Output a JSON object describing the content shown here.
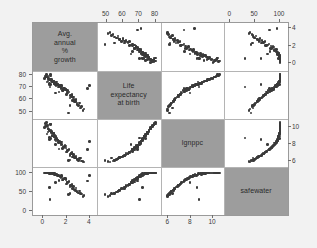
{
  "figure": {
    "type": "scatterplot-matrix",
    "background_color": "#f2f2f2",
    "panel_color": "#ffffff",
    "diagonal_cell_color": "#9d9d9d",
    "point_color": "#3a3a3a",
    "grid_color": "#b4b4b4"
  },
  "variables": [
    {
      "key": "growth",
      "label": "Avg.\nannual\n%\ngrowth",
      "axis_position_x": "bottom",
      "axis_position_y": "right",
      "ticks": [
        0,
        2,
        4
      ],
      "tick_labels": [
        "0",
        "2",
        "4"
      ],
      "range": [
        -0.9,
        4.6
      ]
    },
    {
      "key": "lifeexp",
      "label": "Life\nexpectancy\nat birth",
      "axis_position_x": "top",
      "axis_position_y": "left",
      "ticks": [
        50,
        60,
        70,
        80
      ],
      "tick_labels": [
        "50",
        "60",
        "70",
        "80"
      ],
      "range": [
        44,
        83
      ]
    },
    {
      "key": "lgnppc",
      "label": "lgnppc",
      "axis_position_x": "bottom",
      "axis_position_y": "right",
      "ticks": [
        6,
        8,
        10
      ],
      "tick_labels": [
        "6",
        "8",
        "10"
      ],
      "range": [
        5.3,
        11.0
      ]
    },
    {
      "key": "safewater",
      "label": "safewater",
      "axis_position_x": "top",
      "axis_position_y": "left",
      "ticks": [
        0,
        50,
        100
      ],
      "tick_labels": [
        "0",
        "50",
        "100"
      ],
      "range": [
        -12,
        116
      ]
    }
  ],
  "chart_data": {
    "type": "scatter",
    "title": "",
    "xlabel": "",
    "ylabel": "",
    "matrix_size": 4,
    "variable_names": [
      "Avg. annual % growth",
      "Life expectancy at birth",
      "lgnppc",
      "safewater"
    ],
    "axis_ranges": {
      "growth": [
        -0.9,
        4.6
      ],
      "lifeexp": [
        44,
        83
      ],
      "lgnppc": [
        5.3,
        11.0
      ],
      "safewater": [
        -12,
        116
      ]
    },
    "grid": true,
    "legend": "none",
    "observations": [
      {
        "growth": 0.6,
        "lifeexp": 72,
        "lgnppc": 8.7,
        "safewater": 99
      },
      {
        "growth": 0.3,
        "lifeexp": 74,
        "lgnppc": 9.2,
        "safewater": 100
      },
      {
        "growth": 0.5,
        "lifeexp": 76,
        "lgnppc": 9.6,
        "safewater": 100
      },
      {
        "growth": 0.4,
        "lifeexp": 77,
        "lgnppc": 9.9,
        "safewater": 100
      },
      {
        "growth": 0.7,
        "lifeexp": 75,
        "lgnppc": 9.4,
        "safewater": 100
      },
      {
        "growth": 0.2,
        "lifeexp": 78,
        "lgnppc": 10.1,
        "safewater": 100
      },
      {
        "growth": 0.9,
        "lifeexp": 73,
        "lgnppc": 8.9,
        "safewater": 98
      },
      {
        "growth": 1.1,
        "lifeexp": 71,
        "lgnppc": 8.4,
        "safewater": 96
      },
      {
        "growth": 0.8,
        "lifeexp": 74,
        "lgnppc": 9.0,
        "safewater": 99
      },
      {
        "growth": 0.4,
        "lifeexp": 79,
        "lgnppc": 10.3,
        "safewater": 100
      },
      {
        "growth": 0.1,
        "lifeexp": 77,
        "lgnppc": 10.0,
        "safewater": 100
      },
      {
        "growth": 0.6,
        "lifeexp": 80,
        "lgnppc": 10.4,
        "safewater": 100
      },
      {
        "growth": 1.3,
        "lifeexp": 70,
        "lgnppc": 8.2,
        "safewater": 93
      },
      {
        "growth": 1.5,
        "lifeexp": 69,
        "lgnppc": 7.9,
        "safewater": 88
      },
      {
        "growth": 1.0,
        "lifeexp": 72,
        "lgnppc": 8.6,
        "safewater": 95
      },
      {
        "growth": 1.7,
        "lifeexp": 67,
        "lgnppc": 7.6,
        "safewater": 83
      },
      {
        "growth": 2.1,
        "lifeexp": 65,
        "lgnppc": 7.2,
        "safewater": 74
      },
      {
        "growth": 2.4,
        "lifeexp": 63,
        "lgnppc": 6.9,
        "safewater": 68
      },
      {
        "growth": 2.8,
        "lifeexp": 60,
        "lgnppc": 6.6,
        "safewater": 60
      },
      {
        "growth": 3.1,
        "lifeexp": 57,
        "lgnppc": 6.3,
        "safewater": 52
      },
      {
        "growth": 2.6,
        "lifeexp": 62,
        "lgnppc": 6.8,
        "safewater": 64
      },
      {
        "growth": 2.2,
        "lifeexp": 66,
        "lgnppc": 7.4,
        "safewater": 78
      },
      {
        "growth": 1.9,
        "lifeexp": 68,
        "lgnppc": 7.8,
        "safewater": 86
      },
      {
        "growth": 1.4,
        "lifeexp": 71,
        "lgnppc": 8.3,
        "safewater": 92
      },
      {
        "growth": 0.5,
        "lifeexp": 73,
        "lgnppc": 8.8,
        "safewater": 97
      },
      {
        "growth": 2.0,
        "lifeexp": 64,
        "lgnppc": 7.1,
        "safewater": 71
      },
      {
        "growth": 2.3,
        "lifeexp": 61,
        "lgnppc": 6.7,
        "safewater": 63
      },
      {
        "growth": 2.7,
        "lifeexp": 58,
        "lgnppc": 6.4,
        "safewater": 55
      },
      {
        "growth": 3.0,
        "lifeexp": 55,
        "lgnppc": 6.1,
        "safewater": 47
      },
      {
        "growth": 1.2,
        "lifeexp": 72,
        "lgnppc": 8.5,
        "safewater": 94
      },
      {
        "growth": 0.7,
        "lifeexp": 76,
        "lgnppc": 9.5,
        "safewater": 100
      },
      {
        "growth": 1.6,
        "lifeexp": 70,
        "lgnppc": 8.0,
        "safewater": 90
      },
      {
        "growth": 1.8,
        "lifeexp": 69,
        "lgnppc": 7.7,
        "safewater": 85
      },
      {
        "growth": 2.5,
        "lifeexp": 59,
        "lgnppc": 6.5,
        "safewater": 58
      },
      {
        "growth": 3.3,
        "lifeexp": 54,
        "lgnppc": 6.0,
        "safewater": 44
      },
      {
        "growth": 0.3,
        "lifeexp": 78,
        "lgnppc": 10.2,
        "safewater": 100
      },
      {
        "growth": 0.9,
        "lifeexp": 75,
        "lgnppc": 9.3,
        "safewater": 99
      },
      {
        "growth": 1.1,
        "lifeexp": 73,
        "lgnppc": 8.9,
        "safewater": 97
      },
      {
        "growth": 2.9,
        "lifeexp": 56,
        "lgnppc": 6.2,
        "safewater": 49
      },
      {
        "growth": 3.5,
        "lifeexp": 52,
        "lgnppc": 5.9,
        "safewater": 40
      },
      {
        "growth": 0.2,
        "lifeexp": 79,
        "lgnppc": 10.5,
        "safewater": 100
      },
      {
        "growth": 1.0,
        "lifeexp": 74,
        "lgnppc": 9.1,
        "safewater": 98
      },
      {
        "growth": 2.1,
        "lifeexp": 67,
        "lgnppc": 7.3,
        "safewater": 76
      },
      {
        "growth": 1.5,
        "lifeexp": 71,
        "lgnppc": 8.1,
        "safewater": 91
      },
      {
        "growth": 2.4,
        "lifeexp": 62,
        "lgnppc": 6.95,
        "safewater": 66
      },
      {
        "growth": 0.45,
        "lifeexp": 77,
        "lgnppc": 9.8,
        "safewater": 100
      },
      {
        "growth": 1.25,
        "lifeexp": 72,
        "lgnppc": 8.45,
        "safewater": 95
      },
      {
        "growth": 2.65,
        "lifeexp": 60,
        "lgnppc": 6.55,
        "safewater": 57
      },
      {
        "growth": 0.85,
        "lifeexp": 75,
        "lgnppc": 9.25,
        "safewater": 99
      },
      {
        "growth": 1.95,
        "lifeexp": 68,
        "lgnppc": 7.55,
        "safewater": 82
      },
      {
        "growth": 0.55,
        "lifeexp": 70,
        "lgnppc": 8.75,
        "safewater": 30
      },
      {
        "growth": 2.15,
        "lifeexp": 49,
        "lgnppc": 6.1,
        "safewater": 42
      },
      {
        "growth": 1.35,
        "lifeexp": 66,
        "lgnppc": 7.45,
        "safewater": 80
      },
      {
        "growth": 3.2,
        "lifeexp": 53,
        "lgnppc": 6.35,
        "safewater": 46
      },
      {
        "growth": 0.65,
        "lifeexp": 76,
        "lgnppc": 9.7,
        "safewater": 100
      },
      {
        "growth": 1.45,
        "lifeexp": 70,
        "lgnppc": 8.15,
        "safewater": 89
      },
      {
        "growth": 2.35,
        "lifeexp": 63,
        "lgnppc": 6.85,
        "safewater": 67
      },
      {
        "growth": 0.35,
        "lifeexp": 78,
        "lgnppc": 10.15,
        "safewater": 100
      },
      {
        "growth": 1.75,
        "lifeexp": 69,
        "lgnppc": 7.65,
        "safewater": 84
      },
      {
        "growth": 2.55,
        "lifeexp": 61,
        "lgnppc": 6.6,
        "safewater": 59
      },
      {
        "growth": 0.75,
        "lifeexp": 74,
        "lgnppc": 9.05,
        "safewater": 98
      },
      {
        "growth": 1.55,
        "lifeexp": 71,
        "lgnppc": 8.25,
        "safewater": 93
      },
      {
        "growth": 2.45,
        "lifeexp": 64,
        "lgnppc": 7.05,
        "safewater": 70
      },
      {
        "growth": 0.95,
        "lifeexp": 73,
        "lgnppc": 8.95,
        "safewater": 96
      },
      {
        "growth": 1.65,
        "lifeexp": 67,
        "lgnppc": 7.5,
        "safewater": 81
      },
      {
        "growth": 2.75,
        "lifeexp": 58,
        "lgnppc": 6.45,
        "safewater": 54
      },
      {
        "growth": 0.25,
        "lifeexp": 80,
        "lgnppc": 10.6,
        "safewater": 100
      },
      {
        "growth": 1.85,
        "lifeexp": 68,
        "lgnppc": 7.85,
        "safewater": 87
      },
      {
        "growth": 3.4,
        "lifeexp": 51,
        "lgnppc": 5.95,
        "safewater": 38
      },
      {
        "growth": 0.5,
        "lifeexp": 72,
        "lgnppc": 8.55,
        "safewater": 62
      },
      {
        "growth": 1.05,
        "lifeexp": 65,
        "lgnppc": 7.95,
        "safewater": 75
      },
      {
        "growth": 2.05,
        "lifeexp": 66,
        "lgnppc": 7.15,
        "safewater": 73
      },
      {
        "growth": 0.4,
        "lifeexp": 75,
        "lgnppc": 9.45,
        "safewater": 100
      },
      {
        "growth": 1.15,
        "lifeexp": 74,
        "lgnppc": 8.65,
        "safewater": 97
      },
      {
        "growth": 2.9,
        "lifeexp": 57,
        "lgnppc": 6.25,
        "safewater": 50
      },
      {
        "growth": 0.6,
        "lifeexp": 79,
        "lgnppc": 10.35,
        "safewater": 100
      },
      {
        "growth": 4.0,
        "lifeexp": 71,
        "lgnppc": 8.35,
        "safewater": 94
      },
      {
        "growth": 3.8,
        "lifeexp": 69,
        "lgnppc": 7.4,
        "safewater": 79
      },
      {
        "growth": 2.3,
        "lifeexp": 55,
        "lgnppc": 6.15,
        "safewater": 45
      }
    ]
  }
}
